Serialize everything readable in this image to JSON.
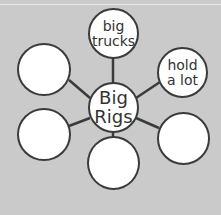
{
  "diagram": {
    "type": "word web",
    "center": {
      "text": "Big\nRigs"
    },
    "spokes": [
      {
        "id": "top",
        "text": "big\ntrucks"
      },
      {
        "id": "right-top",
        "text": "hold\na lot"
      },
      {
        "id": "right-bottom",
        "text": ""
      },
      {
        "id": "bottom",
        "text": ""
      },
      {
        "id": "left-bottom",
        "text": ""
      },
      {
        "id": "left-top",
        "text": ""
      }
    ]
  },
  "colors": {
    "background": "#cacaca",
    "circle_fill": "#ffffff",
    "stroke": "#3a3a3a",
    "text": "#333333"
  }
}
